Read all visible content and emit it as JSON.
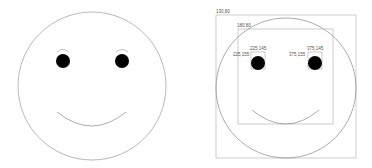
{
  "left_face": {
    "stroke": "#888888",
    "eye_fill": "#000000"
  },
  "right_face": {
    "stroke": "#888888",
    "box_stroke": "#999999",
    "labels": {
      "outer_box": "130,80",
      "inner_box": "180,80",
      "left_eye_top": "225,145",
      "left_eye_side": "225,155",
      "right_eye_top": "375,145",
      "right_eye_side": "375,155"
    }
  }
}
